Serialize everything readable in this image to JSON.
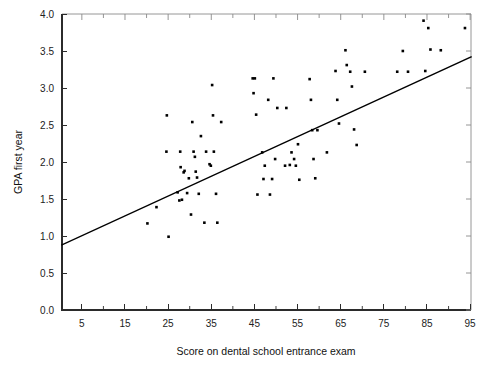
{
  "chart_data": {
    "type": "scatter",
    "title": "",
    "xlabel": "Score on dental school entrance exam",
    "ylabel": "GPA first year",
    "xlim": [
      0.4,
      95.2
    ],
    "ylim": [
      0.0,
      4.0
    ],
    "grid": false,
    "legend": null,
    "xticks": [
      5,
      15,
      25,
      35,
      45,
      55,
      65,
      75,
      85,
      95
    ],
    "xtick_labels": [
      "5",
      "15",
      "25",
      "35",
      "45",
      "55",
      "65",
      "75",
      "85",
      "95"
    ],
    "xminor_ticks": [
      10,
      20,
      30,
      40,
      50,
      60,
      70,
      80,
      90
    ],
    "yticks": [
      0.0,
      0.5,
      1.0,
      1.5,
      2.0,
      2.5,
      3.0,
      3.5,
      4.0
    ],
    "ytick_labels": [
      "0.0",
      "0.5",
      "1.0",
      "1.5",
      "2.0",
      "2.5",
      "3.0",
      "3.5",
      "4.0"
    ],
    "marker": "filled-square",
    "marker_color": "#000000",
    "fit_line": {
      "type": "linear-regression",
      "color": "#000000",
      "x_start": 0.4,
      "y_start": 0.88,
      "x_end": 95.2,
      "y_end": 3.42,
      "slope": 0.0268,
      "intercept": 0.869
    },
    "points": [
      [
        20.2,
        1.17
      ],
      [
        22.3,
        1.39
      ],
      [
        24.7,
        2.63
      ],
      [
        24.6,
        2.14
      ],
      [
        25.1,
        0.99
      ],
      [
        27.2,
        1.59
      ],
      [
        27.6,
        1.48
      ],
      [
        27.8,
        2.14
      ],
      [
        27.9,
        1.93
      ],
      [
        28.2,
        1.49
      ],
      [
        28.6,
        1.86
      ],
      [
        28.8,
        1.88
      ],
      [
        29.4,
        1.58
      ],
      [
        29.8,
        1.78
      ],
      [
        30.3,
        1.29
      ],
      [
        30.6,
        2.54
      ],
      [
        30.9,
        2.14
      ],
      [
        31.2,
        2.07
      ],
      [
        31.4,
        1.87
      ],
      [
        31.7,
        1.79
      ],
      [
        32.1,
        1.57
      ],
      [
        32.6,
        2.35
      ],
      [
        33.4,
        1.18
      ],
      [
        33.8,
        2.14
      ],
      [
        34.6,
        1.97
      ],
      [
        34.9,
        1.95
      ],
      [
        35.2,
        3.04
      ],
      [
        35.4,
        2.63
      ],
      [
        35.6,
        2.14
      ],
      [
        36.1,
        1.57
      ],
      [
        36.4,
        1.18
      ],
      [
        37.3,
        2.54
      ],
      [
        44.6,
        3.13
      ],
      [
        44.8,
        2.93
      ],
      [
        45.1,
        3.13
      ],
      [
        45.4,
        2.64
      ],
      [
        45.7,
        1.56
      ],
      [
        46.8,
        2.13
      ],
      [
        47.1,
        1.77
      ],
      [
        47.4,
        1.95
      ],
      [
        48.2,
        2.84
      ],
      [
        48.6,
        1.56
      ],
      [
        49.1,
        1.77
      ],
      [
        49.4,
        3.13
      ],
      [
        49.8,
        2.04
      ],
      [
        50.3,
        2.73
      ],
      [
        52.1,
        1.95
      ],
      [
        52.4,
        2.73
      ],
      [
        53.2,
        1.96
      ],
      [
        53.6,
        2.13
      ],
      [
        54.2,
        2.04
      ],
      [
        54.6,
        1.95
      ],
      [
        55.1,
        2.24
      ],
      [
        55.4,
        1.76
      ],
      [
        57.8,
        3.12
      ],
      [
        58.1,
        2.84
      ],
      [
        58.4,
        2.43
      ],
      [
        58.7,
        2.04
      ],
      [
        59.1,
        1.78
      ],
      [
        59.6,
        2.43
      ],
      [
        61.8,
        2.13
      ],
      [
        63.8,
        3.23
      ],
      [
        64.2,
        2.84
      ],
      [
        64.6,
        2.52
      ],
      [
        66.1,
        3.51
      ],
      [
        66.4,
        3.31
      ],
      [
        67.2,
        3.22
      ],
      [
        67.6,
        3.02
      ],
      [
        68.1,
        2.44
      ],
      [
        68.7,
        2.23
      ],
      [
        70.6,
        3.22
      ],
      [
        78.1,
        3.22
      ],
      [
        79.4,
        3.5
      ],
      [
        80.6,
        3.22
      ],
      [
        84.2,
        3.91
      ],
      [
        84.6,
        3.23
      ],
      [
        85.3,
        3.81
      ],
      [
        85.8,
        3.52
      ],
      [
        88.2,
        3.51
      ],
      [
        93.8,
        3.81
      ]
    ]
  }
}
